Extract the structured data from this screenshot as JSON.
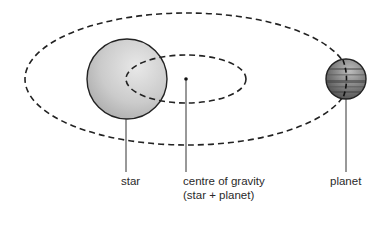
{
  "diagram": {
    "labels": {
      "star": "star",
      "centre_of_gravity_line1": "centre of gravity",
      "centre_of_gravity_line2": "(star + planet)",
      "planet": "planet"
    },
    "elements": {
      "outer_orbit": {
        "type": "dashed-ellipse",
        "cx": 187,
        "cy": 79,
        "rx": 162,
        "ry": 66,
        "represents": "planet orbit"
      },
      "inner_orbit": {
        "type": "dashed-ellipse",
        "cx": 186,
        "cy": 79,
        "rx": 60,
        "ry": 24,
        "represents": "star orbit"
      },
      "star": {
        "type": "sphere",
        "cx": 127,
        "cy": 79,
        "r": 40
      },
      "centre_of_gravity": {
        "type": "dot",
        "cx": 186,
        "cy": 79
      },
      "planet": {
        "type": "banded-sphere",
        "cx": 346,
        "cy": 79,
        "r": 20
      }
    },
    "colors": {
      "star_fill": "#c8c8c8",
      "star_highlight": "#e6e6e6",
      "planet_fill": "#8a8a8a",
      "planet_dark": "#555555",
      "line": "#222222",
      "text": "#2a2a2a"
    }
  }
}
